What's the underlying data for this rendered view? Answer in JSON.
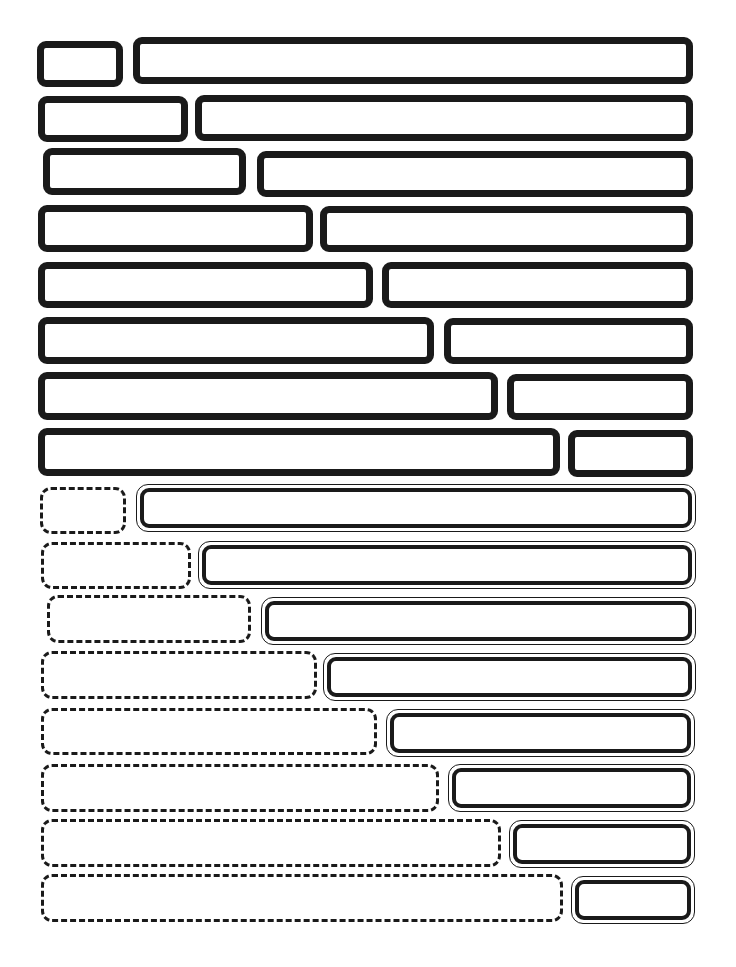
{
  "diagram": {
    "colors": {
      "stroke": "#1a1a1a",
      "background": "#ffffff"
    },
    "solid_group": {
      "style_left": "solid-thick",
      "style_right": "solid-thick",
      "rows": [
        {
          "left": {
            "x": 37,
            "y": 41,
            "w": 86,
            "h": 46
          },
          "right": {
            "x": 133,
            "y": 37,
            "w": 560,
            "h": 47
          }
        },
        {
          "left": {
            "x": 38,
            "y": 96,
            "w": 150,
            "h": 46
          },
          "right": {
            "x": 195,
            "y": 95,
            "w": 498,
            "h": 46
          }
        },
        {
          "left": {
            "x": 43,
            "y": 148,
            "w": 203,
            "h": 47
          },
          "right": {
            "x": 257,
            "y": 151,
            "w": 436,
            "h": 46
          }
        },
        {
          "left": {
            "x": 38,
            "y": 205,
            "w": 275,
            "h": 47
          },
          "right": {
            "x": 320,
            "y": 206,
            "w": 373,
            "h": 46
          }
        },
        {
          "left": {
            "x": 38,
            "y": 262,
            "w": 335,
            "h": 46
          },
          "right": {
            "x": 382,
            "y": 262,
            "w": 311,
            "h": 46
          }
        },
        {
          "left": {
            "x": 38,
            "y": 317,
            "w": 396,
            "h": 47
          },
          "right": {
            "x": 444,
            "y": 318,
            "w": 249,
            "h": 46
          }
        },
        {
          "left": {
            "x": 38,
            "y": 372,
            "w": 460,
            "h": 48
          },
          "right": {
            "x": 507,
            "y": 374,
            "w": 186,
            "h": 46
          }
        },
        {
          "left": {
            "x": 38,
            "y": 428,
            "w": 522,
            "h": 48
          },
          "right": {
            "x": 568,
            "y": 430,
            "w": 125,
            "h": 47
          }
        }
      ]
    },
    "dashed_double_group": {
      "style_left": "dashed",
      "style_right": "double-outline",
      "rows": [
        {
          "left": {
            "x": 40,
            "y": 487,
            "w": 86,
            "h": 47
          },
          "right": {
            "x": 136,
            "y": 484,
            "w": 560,
            "h": 48
          }
        },
        {
          "left": {
            "x": 41,
            "y": 542,
            "w": 150,
            "h": 47
          },
          "right": {
            "x": 198,
            "y": 541,
            "w": 498,
            "h": 48
          }
        },
        {
          "left": {
            "x": 47,
            "y": 595,
            "w": 204,
            "h": 48
          },
          "right": {
            "x": 261,
            "y": 597,
            "w": 435,
            "h": 48
          }
        },
        {
          "left": {
            "x": 41,
            "y": 651,
            "w": 276,
            "h": 48
          },
          "right": {
            "x": 323,
            "y": 653,
            "w": 373,
            "h": 48
          }
        },
        {
          "left": {
            "x": 41,
            "y": 708,
            "w": 336,
            "h": 47
          },
          "right": {
            "x": 386,
            "y": 709,
            "w": 309,
            "h": 48
          }
        },
        {
          "left": {
            "x": 41,
            "y": 764,
            "w": 398,
            "h": 48
          },
          "right": {
            "x": 448,
            "y": 764,
            "w": 247,
            "h": 48
          }
        },
        {
          "left": {
            "x": 41,
            "y": 819,
            "w": 460,
            "h": 48
          },
          "right": {
            "x": 509,
            "y": 820,
            "w": 186,
            "h": 48
          }
        },
        {
          "left": {
            "x": 41,
            "y": 874,
            "w": 522,
            "h": 48
          },
          "right": {
            "x": 571,
            "y": 876,
            "w": 124,
            "h": 48
          }
        }
      ]
    }
  }
}
